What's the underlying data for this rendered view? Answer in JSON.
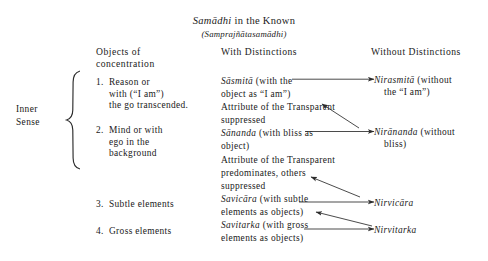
{
  "title": {
    "main_italic": "Samādhi",
    "main_rest": " in the Known",
    "sub": "(Samprajñātasamādhi)"
  },
  "headers": {
    "objects_line1": "Objects of",
    "objects_line2": "concentration",
    "with_distinctions": "With Distinctions",
    "without_distinctions": "Without Distinctions"
  },
  "side_label": {
    "line1": "Inner",
    "line2": "Sense"
  },
  "left_column": [
    {
      "number": "1.",
      "lines": [
        "Reason or",
        "with (“I am”)",
        "the go transcended."
      ]
    },
    {
      "number": "2.",
      "lines": [
        "Mind or with",
        "ego in the",
        "background"
      ]
    },
    {
      "number": "3.",
      "lines": [
        "Subtle elements"
      ]
    },
    {
      "number": "4.",
      "lines": [
        "Gross elements"
      ]
    }
  ],
  "middle_column": [
    {
      "italic": "Sāsmitā",
      "rest": " (with the"
    },
    {
      "italic": "",
      "rest": "object as “I am”)"
    },
    {
      "italic": "",
      "rest": "Attribute of the Transparent"
    },
    {
      "italic": "",
      "rest": "suppressed"
    },
    {
      "italic": "Sānanda",
      "rest": " (with bliss as"
    },
    {
      "italic": "",
      "rest": "object)"
    },
    {
      "italic": "",
      "rest": "Attribute of the Transparent"
    },
    {
      "italic": "",
      "rest": "predominates, others"
    },
    {
      "italic": "",
      "rest": "suppressed"
    },
    {
      "italic": "Savicāra",
      "rest": " (with subtle"
    },
    {
      "italic": "",
      "rest": "elements as objects)"
    },
    {
      "italic": "Savitarka",
      "rest": " (with gross"
    },
    {
      "italic": "",
      "rest": "elements as objects)"
    }
  ],
  "right_column": [
    {
      "italic": "Nirasmitā",
      "rest": " (without",
      "line2": "the “I am”)"
    },
    {
      "italic": "Nirānanda",
      "rest": " (without",
      "line2": "bliss)"
    },
    {
      "italic": "Nirvicāra",
      "rest": "",
      "line2": ""
    },
    {
      "italic": "Nirvitarka",
      "rest": "",
      "line2": ""
    }
  ],
  "colors": {
    "ink": "#1a1a1a",
    "page": "#ffffff",
    "rule": "#2b2b2b"
  }
}
